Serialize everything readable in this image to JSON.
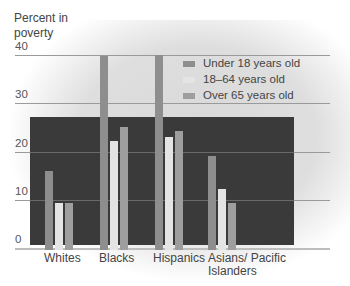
{
  "chart_data": {
    "type": "bar",
    "title": "",
    "xlabel": "",
    "ylabel": "Percent in poverty",
    "ylim": [
      0,
      40
    ],
    "yticks": [
      0,
      10,
      20,
      30,
      40
    ],
    "grid": true,
    "legend_position": "upper right",
    "categories": [
      "Whites",
      "Blacks",
      "Hispanics",
      "Asians/ Pacific Islanders"
    ],
    "series": [
      {
        "name": "Under 18 years old",
        "values": [
          16,
          40,
          40.3,
          19.2
        ],
        "color": "#8e8e8e"
      },
      {
        "name": "18–64 years old",
        "values": [
          9.4,
          22.3,
          23.2,
          12.3
        ],
        "color": "#e4e4e4"
      },
      {
        "name": "Over 65 years old",
        "values": [
          9.4,
          25.2,
          24.4,
          9.4
        ],
        "color": "#9e9e9e"
      }
    ]
  },
  "labels": {
    "ylabel_line1": "Percent in",
    "ylabel_line2": "poverty",
    "ticks": [
      "40",
      "30",
      "20",
      "10",
      "0"
    ],
    "categories": [
      "Whites",
      "Blacks",
      "Hispanics",
      "Asians/ Pacific",
      "Islanders"
    ],
    "legend": [
      "Under 18 years old",
      "18–64 years old",
      "Over 65 years old"
    ]
  }
}
